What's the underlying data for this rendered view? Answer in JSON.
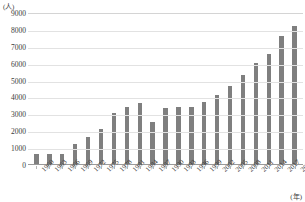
{
  "chart_data": {
    "type": "bar",
    "title": "",
    "xlabel": "(年)",
    "ylabel": "(人)",
    "ylim": [
      0,
      9000
    ],
    "ytick_step": 1000,
    "yticks": [
      0,
      1000,
      2000,
      3000,
      4000,
      5000,
      6000,
      7000,
      8000,
      9000
    ],
    "grid": true,
    "legend": "none",
    "bar_color": "#7f7f7f",
    "categories": [
      "1960",
      "1963",
      "1966",
      "1969",
      "1972",
      "1975",
      "1978",
      "1981",
      "1984",
      "1987",
      "1990",
      "1993",
      "1996",
      "1999",
      "2002",
      "2005",
      "2008",
      "2011",
      "2014",
      "2017",
      "2020"
    ],
    "values": [
      600,
      600,
      600,
      1200,
      1600,
      2100,
      3000,
      3400,
      3600,
      2500,
      3300,
      3400,
      3400,
      3700,
      4100,
      4600,
      5300,
      6000,
      6500,
      7600,
      8200
    ]
  },
  "axis": {
    "y_unit": "(人)",
    "x_unit": "(年)"
  }
}
